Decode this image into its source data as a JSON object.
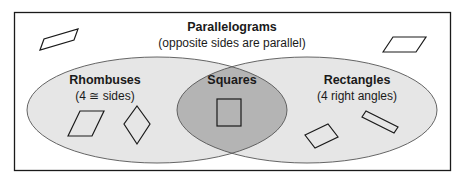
{
  "diagram": {
    "type": "venn",
    "colors": {
      "outer_fill": "#ffffff",
      "set_fill": "#e6e6e6",
      "intersection_fill": "#b4b4b4",
      "stroke": "#1a1a1a"
    },
    "universe": {
      "title": "Parallelograms",
      "subtitle": "(opposite sides are parallel)"
    },
    "sets": [
      {
        "id": "rhombuses",
        "title": "Rhombuses",
        "subtitle": "(4 ≅ sides)"
      },
      {
        "id": "rectangles",
        "title": "Rectangles",
        "subtitle": "(4 right angles)"
      }
    ],
    "intersection": {
      "title": "Squares"
    },
    "example_shapes": {
      "parallelograms": [
        "parallelogram",
        "parallelogram"
      ],
      "rhombuses": [
        "rhombus",
        "rhombus-diamond"
      ],
      "squares": [
        "square"
      ],
      "rectangles": [
        "rectangle",
        "rectangle"
      ]
    }
  }
}
